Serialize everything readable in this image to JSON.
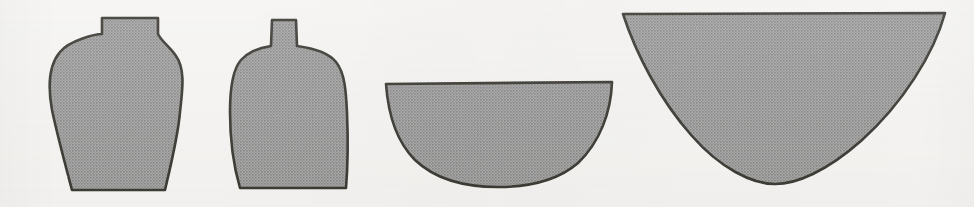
{
  "plate": {
    "title": "Vessel profile silhouettes",
    "background_color": "#f6f5f3",
    "outline_color": "#15130f",
    "fill_color": "#8a8a8a",
    "halftone_dark": "#6e6e6e",
    "halftone_light": "#9d9d9d",
    "width": 974,
    "height": 207,
    "figure_count": 4,
    "orientation": "horizontal row"
  },
  "figures": [
    {
      "index": 1,
      "name": "globular-jar",
      "label": "Globular jar with short everted rim",
      "form": "closed jar",
      "rim_label": "short straight rim",
      "body_label": "rounded shoulder, tapering body",
      "base_label": "flat base",
      "bbox": {
        "x": 40,
        "y": 16,
        "width": 142,
        "height": 177
      },
      "rim_width_px": 58,
      "max_body_width_px": 142,
      "base_width_px": 92,
      "height_px": 177,
      "path": "M 102 18 L 158 18 L 158 34 C 162 42 170 47 176 56 C 186 70 182 92 180 112 C 178 136 172 160 165 190 L 72 190 C 64 160 57 134 52 110 C 48 88 48 66 60 52 C 70 40 96 34 102 34 Z"
    },
    {
      "index": 2,
      "name": "narrow-necked-bottle",
      "label": "Narrow-necked bottle with square shoulder",
      "form": "closed bottle",
      "rim_label": "narrow cylindrical neck",
      "body_label": "square shoulder, near-vertical walls",
      "base_label": "flat base",
      "bbox": {
        "x": 229,
        "y": 19,
        "width": 120,
        "height": 170
      },
      "rim_width_px": 26,
      "max_body_width_px": 120,
      "base_width_px": 100,
      "height_px": 170,
      "path": "M 272 20 L 296 20 L 297 46 C 312 48 328 52 336 62 C 345 73 346 92 347 112 C 348 136 348 164 346 188 L 240 188 C 233 164 230 136 230 112 C 230 90 232 70 241 60 C 250 50 264 47 271 46 Z"
    },
    {
      "index": 3,
      "name": "hemispherical-bowl",
      "label": "Hemispherical bowl",
      "form": "open bowl",
      "rim_label": "plain direct rim",
      "body_label": "hemispherical profile",
      "base_label": "rounded base",
      "bbox": {
        "x": 385,
        "y": 82,
        "width": 228,
        "height": 105
      },
      "rim_width_px": 228,
      "depth_px": 105,
      "rim_to_depth_ratio": "2.2 : 1",
      "path": "M 386 84 L 612 82 C 611 112 600 142 578 163 C 556 182 526 187 498 187 C 468 187 436 180 415 160 C 396 141 388 112 386 84 Z"
    },
    {
      "index": 4,
      "name": "deep-conical-bowl",
      "label": "Deep conical bowl with rounded base",
      "form": "open bowl",
      "rim_label": "plain direct rim",
      "body_label": "flaring conical walls",
      "base_label": "rounded base",
      "bbox": {
        "x": 622,
        "y": 12,
        "width": 324,
        "height": 172
      },
      "rim_width_px": 324,
      "depth_px": 172,
      "rim_to_depth_ratio": "1.9 : 1",
      "path": "M 623 14 L 945 13 C 934 54 902 104 862 140 C 826 172 796 184 775 184 C 752 184 720 168 692 136 C 660 100 636 54 623 14 Z"
    }
  ]
}
